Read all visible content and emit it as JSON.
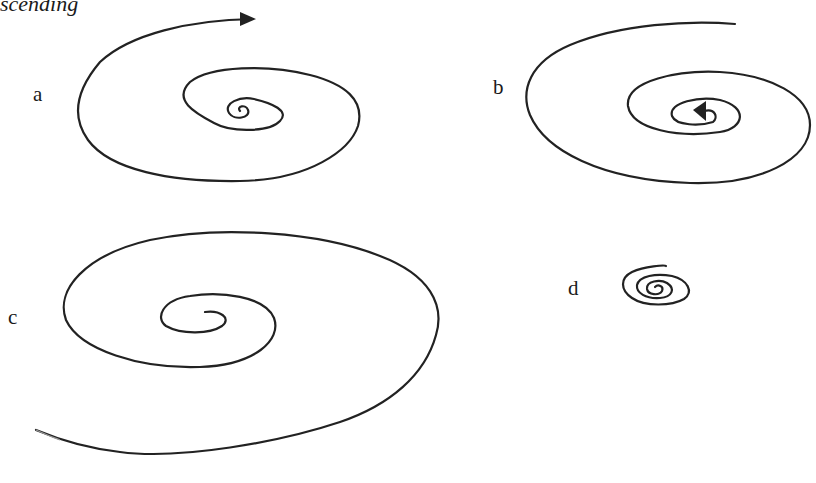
{
  "heading": "scending",
  "panels": [
    {
      "label": "a",
      "description": "spiral expanding outward, arrow at outer end pointing right"
    },
    {
      "label": "b",
      "description": "spiral contracting inward, arrow at center"
    },
    {
      "label": "c",
      "description": "large spiral expanding outward, tail fading at lower left"
    },
    {
      "label": "d",
      "description": "small tight spiral"
    }
  ],
  "colors": {
    "stroke": "#222222",
    "background": "#ffffff"
  }
}
